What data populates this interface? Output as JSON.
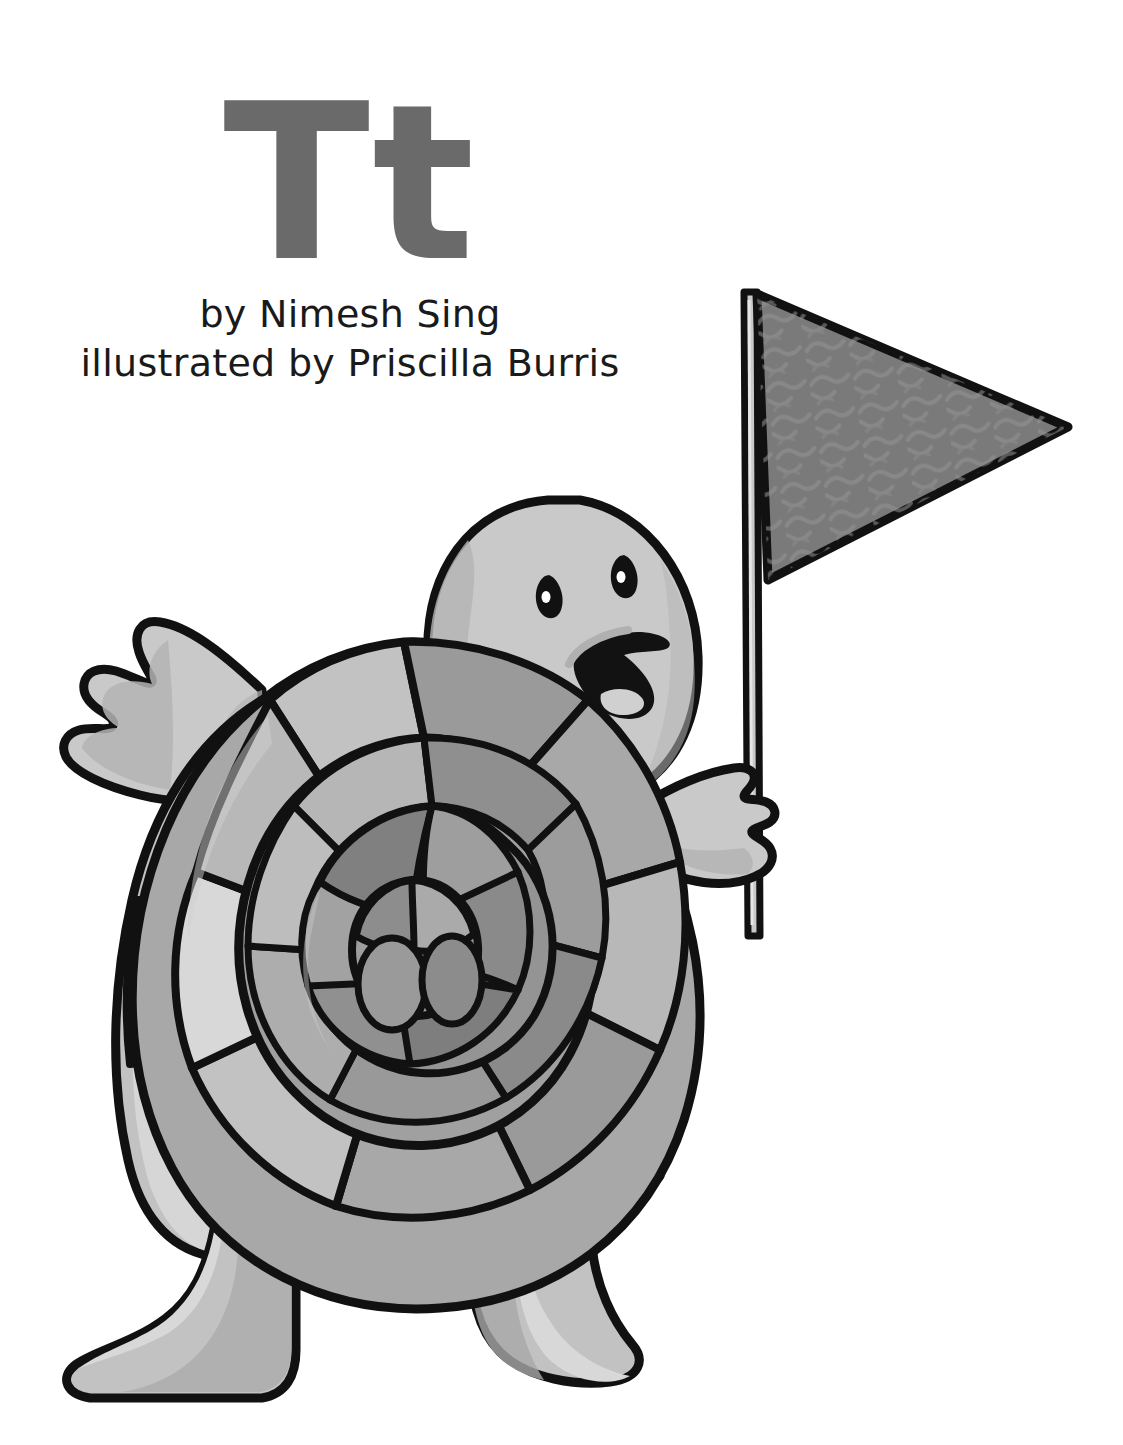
{
  "page": {
    "background_color": "#ffffff",
    "width": 1123,
    "height": 1445
  },
  "title": {
    "letter_pair": "Tt",
    "letter_color": "#6a6a6a"
  },
  "credits": {
    "author_line": "by Nimesh Sing",
    "illustrator_line": "illustrated by Priscilla Burris",
    "text_color": "#1a1a1a"
  },
  "illustration": {
    "subject": "cartoon turtle holding a pennant flag",
    "outline_color": "#111111",
    "palette": {
      "skin_light": "#c9c9c9",
      "skin_shadow": "#b0b0b0",
      "shell_lightest": "#d8d8d8",
      "shell_light": "#c2c2c2",
      "shell_mid": "#a8a8a8",
      "shell_dark": "#8f8f8f",
      "shell_darkest": "#7e7e7e",
      "flag_fill": "#7a7a7a",
      "flag_texture": "#8e8e8e",
      "pole_fill": "#c9c9c9",
      "mouth_interior": "#121212",
      "tongue": "#d0d0d0",
      "eye": "#111111",
      "eye_highlight": "#ffffff"
    },
    "parts": [
      {
        "name": "flag-pennant",
        "label": "triangular pennant flag"
      },
      {
        "name": "flag-pole",
        "label": "flag pole"
      },
      {
        "name": "turtle-head",
        "label": "turtle head"
      },
      {
        "name": "turtle-eye-left",
        "label": "left eye"
      },
      {
        "name": "turtle-eye-right",
        "label": "right eye"
      },
      {
        "name": "turtle-mouth",
        "label": "open smiling mouth"
      },
      {
        "name": "turtle-shell",
        "label": "patterned shell"
      },
      {
        "name": "turtle-arm-left",
        "label": "raised left arm with three claws"
      },
      {
        "name": "turtle-arm-right",
        "label": "right arm gripping pole"
      },
      {
        "name": "turtle-leg-left",
        "label": "left leg and foot"
      },
      {
        "name": "turtle-leg-right",
        "label": "right leg and foot"
      }
    ]
  }
}
